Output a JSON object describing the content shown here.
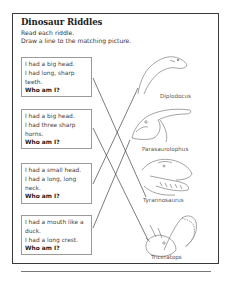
{
  "worksheet": {
    "title": "Dinosaur Riddles",
    "instructions": [
      "Read each riddle.",
      "Draw a line to the matching picture."
    ],
    "riddles": [
      {
        "lines": [
          "I had a big head.",
          "I had long, sharp",
          "teeth."
        ],
        "question": "Who am I?"
      },
      {
        "lines": [
          "I had a big head.",
          "I had three sharp",
          "horns."
        ],
        "question": "Who am I?"
      },
      {
        "lines": [
          "I had a small head.",
          "I had a long, long",
          "neck."
        ],
        "question": "Who am I?"
      },
      {
        "lines": [
          "I had a mouth like a",
          "duck.",
          "I had a long crest."
        ],
        "question": "Who am I?"
      }
    ],
    "pictures": [
      {
        "name": "Diplodocus",
        "icon": "diplodocus-icon"
      },
      {
        "name": "Parasaurolophus",
        "icon": "parasaurolophus-icon"
      },
      {
        "name": "Tyrannosaurus",
        "icon": "tyrannosaurus-icon"
      },
      {
        "name": "Triceratops",
        "icon": "triceratops-icon"
      }
    ],
    "matches": [
      {
        "riddle": 1,
        "picture": "Tyrannosaurus"
      },
      {
        "riddle": 2,
        "picture": "Triceratops"
      },
      {
        "riddle": 3,
        "picture": "Diplodocus"
      },
      {
        "riddle": 4,
        "picture": "Parasaurolophus"
      }
    ],
    "colors": {
      "border": "#3a3a3a",
      "box_border": "#9a9a9a",
      "line": "#444444",
      "text": "#333333"
    }
  }
}
